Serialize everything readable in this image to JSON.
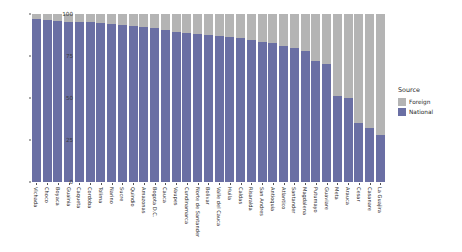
{
  "chart_data": {
    "type": "bar",
    "stacked": true,
    "title": "",
    "xlabel": "",
    "ylabel": "VA Share (%)",
    "ylim": [
      0,
      100
    ],
    "yticks": [
      0,
      25,
      50,
      75,
      100
    ],
    "grid": false,
    "legend": {
      "title": "Source",
      "position": "right",
      "entries": [
        {
          "name": "Foreign",
          "color": "#b4b4b4"
        },
        {
          "name": "National",
          "color": "#6a6fa4"
        }
      ]
    },
    "categories": [
      "Vichada",
      "Choco",
      "Boyaca",
      "Guainia",
      "Caqueta",
      "Cordoba",
      "Tolima",
      "Narino",
      "Sucre",
      "Quindio",
      "Amazonas",
      "Bogota D.C.",
      "Cauca",
      "Vaupes",
      "Cundinamarca",
      "Norte de Santander",
      "Bolivar",
      "Valle del Cauca",
      "Huila",
      "Caldas",
      "Risaralda",
      "San Andres",
      "Antioquia",
      "Atlantico",
      "Santander",
      "Magdalena",
      "Putumayo",
      "Guaviare",
      "Meta",
      "Arauca",
      "Cesar",
      "Casanare",
      "La Guajira"
    ],
    "series": [
      {
        "name": "National",
        "color": "#6a6fa4",
        "values": [
          97,
          96.5,
          96,
          95.5,
          95.5,
          95,
          94.5,
          94,
          93.5,
          93,
          92.5,
          91.5,
          90.5,
          89.5,
          88.5,
          88,
          87.5,
          87,
          86.5,
          85.5,
          84.5,
          83.5,
          82.5,
          81,
          79.5,
          78,
          72,
          70,
          51,
          50,
          35,
          32,
          28
        ]
      },
      {
        "name": "Foreign",
        "color": "#b4b4b4",
        "values": [
          3,
          3.5,
          4,
          4.5,
          4.5,
          5,
          5.5,
          6,
          6.5,
          7,
          7.5,
          8.5,
          9.5,
          10.5,
          11.5,
          12,
          12.5,
          13,
          13.5,
          14.5,
          15.5,
          16.5,
          17.5,
          19,
          20.5,
          22,
          28,
          30,
          49,
          50,
          65,
          68,
          72
        ]
      }
    ]
  }
}
